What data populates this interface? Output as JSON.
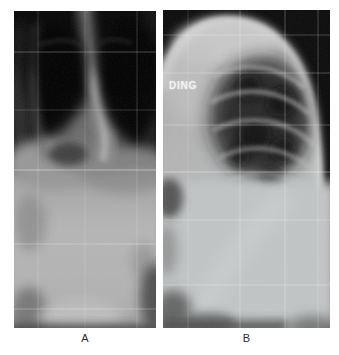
{
  "figure": {
    "panels": [
      {
        "label": "A",
        "alt": "frontal standing spine-and-chest radiograph with stitched film grid lines",
        "overlay_text": ""
      },
      {
        "label": "B",
        "alt": "lateral standing chest radiograph with stitched film grid lines",
        "overlay_text": "DING"
      }
    ],
    "colors": {
      "page_background": "#ffffff",
      "film_black": "#0a0a0a",
      "soft_tissue_gray": "#b8b8b8",
      "bright_rim": "#dedede",
      "grid_line": "#ffffff",
      "caption_text": "#2b2b2b",
      "overlay_text": "#f2f2f2"
    }
  }
}
